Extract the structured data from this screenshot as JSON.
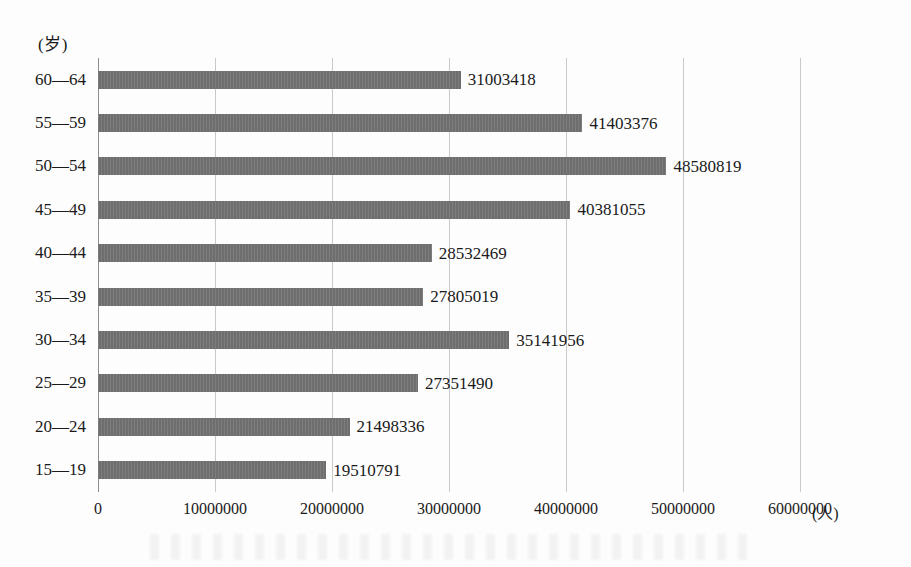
{
  "chart_data": {
    "type": "bar",
    "orientation": "horizontal",
    "title": "",
    "xlabel": "(人)",
    "ylabel": "(岁)",
    "categories": [
      "60—64",
      "55—59",
      "50—54",
      "45—49",
      "40—44",
      "35—39",
      "30—34",
      "25—29",
      "20—24",
      "15—19"
    ],
    "values": [
      31003418,
      41403376,
      48580819,
      40381055,
      28532469,
      27805019,
      35141956,
      27351490,
      21498336,
      19510791
    ],
    "value_labels": [
      "31003418",
      "41403376",
      "48580819",
      "40381055",
      "28532469",
      "27805019",
      "35141956",
      "27351490",
      "21498336",
      "19510791"
    ],
    "xlim": [
      0,
      60000000
    ],
    "xticks": [
      0,
      10000000,
      20000000,
      30000000,
      40000000,
      50000000,
      60000000
    ],
    "xtick_labels": [
      "0",
      "10000000",
      "20000000",
      "30000000",
      "40000000",
      "50000000",
      "60000000"
    ],
    "grid": true,
    "legend": false,
    "bar_color": "#6e6e6e",
    "gridline_color": "#c9c9c9",
    "axis_color": "#8d8d8d"
  },
  "axes": {
    "y_unit": "(岁)",
    "x_unit": "(人)"
  }
}
